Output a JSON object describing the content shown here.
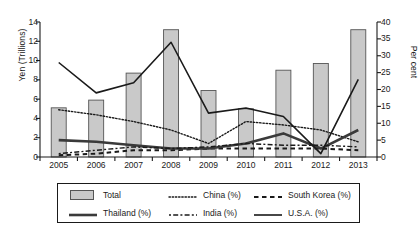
{
  "chart_data": {
    "type": "bar",
    "title": "",
    "subtitle": "",
    "xlabel": "",
    "ylabel": "Yen (Trillions)",
    "y2label": "Per cent",
    "ylim": [
      0,
      14
    ],
    "y2lim": [
      0,
      40
    ],
    "ytick_step": 2,
    "y2tick_step": 5,
    "grid": false,
    "legend_position": "bottom",
    "categories": [
      "2005",
      "2006",
      "2007",
      "2008",
      "2009",
      "2010",
      "2011",
      "2012",
      "2013"
    ],
    "yticks": [
      "0",
      "2",
      "4",
      "6",
      "8",
      "10",
      "12",
      "14"
    ],
    "y2ticks": [
      "0",
      "5",
      "10",
      "15",
      "20",
      "25",
      "30",
      "35",
      "40"
    ],
    "bar_series": {
      "name": "Total",
      "axis": "left",
      "unit": "Yen (Trillions)",
      "values": [
        5.1,
        5.9,
        8.7,
        13.2,
        6.9,
        5.0,
        9.0,
        9.7,
        13.2
      ],
      "fill": "#c9c9c9",
      "stroke": "#555555"
    },
    "series": [
      {
        "name": "China (%)",
        "axis": "right",
        "style": "dotted",
        "color": "#1a1a1a",
        "values": [
          14.0,
          12.5,
          10.5,
          8.0,
          4.0,
          10.5,
          9.5,
          8.0,
          4.5
        ]
      },
      {
        "name": "South Korea (%)",
        "axis": "right",
        "style": "dashed",
        "color": "#1a1a1a",
        "values": [
          0.5,
          1.0,
          2.0,
          2.0,
          2.5,
          2.5,
          2.5,
          2.5,
          2.0
        ]
      },
      {
        "name": "Thailand (%)",
        "axis": "right",
        "style": "solid-thick",
        "color": "#3a3a3a",
        "values": [
          5.0,
          4.5,
          3.5,
          2.5,
          2.5,
          4.0,
          7.0,
          2.5,
          8.0
        ]
      },
      {
        "name": "India (%)",
        "axis": "right",
        "style": "dash-dot",
        "color": "#1a1a1a",
        "values": [
          1.0,
          2.0,
          3.0,
          2.5,
          3.0,
          4.0,
          3.5,
          3.5,
          3.0
        ]
      },
      {
        "name": "U.S.A. (%)",
        "axis": "right",
        "style": "solid",
        "color": "#1a1a1a",
        "values": [
          28.0,
          19.0,
          22.0,
          34.0,
          13.0,
          14.5,
          12.0,
          1.0,
          23.0
        ]
      }
    ]
  },
  "legend": {
    "items": [
      {
        "label": "Total",
        "symbol": "bar-swatch"
      },
      {
        "label": "China (%)",
        "symbol": "dotted-line"
      },
      {
        "label": "South Korea (%)",
        "symbol": "dashed-line"
      },
      {
        "label": "Thailand (%)",
        "symbol": "thick-line"
      },
      {
        "label": "India (%)",
        "symbol": "dash-dot-line"
      },
      {
        "label": "U.S.A. (%)",
        "symbol": "solid-line"
      }
    ]
  }
}
